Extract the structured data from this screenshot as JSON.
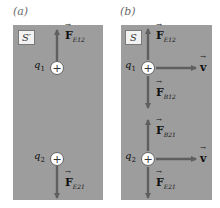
{
  "panels": [
    {
      "id": "a",
      "label": "(a)",
      "frame": "S′",
      "charges": [
        {
          "name": "q1",
          "symbol": "+",
          "label_base": "q",
          "label_sub": "1",
          "forces": [
            {
              "direction": "up",
              "base": "F",
              "sub": "E12"
            }
          ]
        },
        {
          "name": "q2",
          "symbol": "+",
          "label_base": "q",
          "label_sub": "2",
          "forces": [
            {
              "direction": "down",
              "base": "F",
              "sub": "E21"
            }
          ]
        }
      ]
    },
    {
      "id": "b",
      "label": "(b)",
      "frame": "S",
      "charges": [
        {
          "name": "q1",
          "symbol": "+",
          "label_base": "q",
          "label_sub": "1",
          "forces": [
            {
              "direction": "up",
              "base": "F",
              "sub": "E12"
            },
            {
              "direction": "down",
              "base": "F",
              "sub": "B12"
            }
          ],
          "velocity": {
            "direction": "right",
            "label": "v"
          }
        },
        {
          "name": "q2",
          "symbol": "+",
          "label_base": "q",
          "label_sub": "2",
          "forces": [
            {
              "direction": "up",
              "base": "F",
              "sub": "B21"
            },
            {
              "direction": "down",
              "base": "F",
              "sub": "E21"
            }
          ],
          "velocity": {
            "direction": "right",
            "label": "v"
          }
        }
      ]
    }
  ],
  "colors": {
    "panel_bg": "#9d9d9d",
    "arrow": "#5f5f5f",
    "charge_fill": "#ffffff",
    "text": "#111111"
  }
}
